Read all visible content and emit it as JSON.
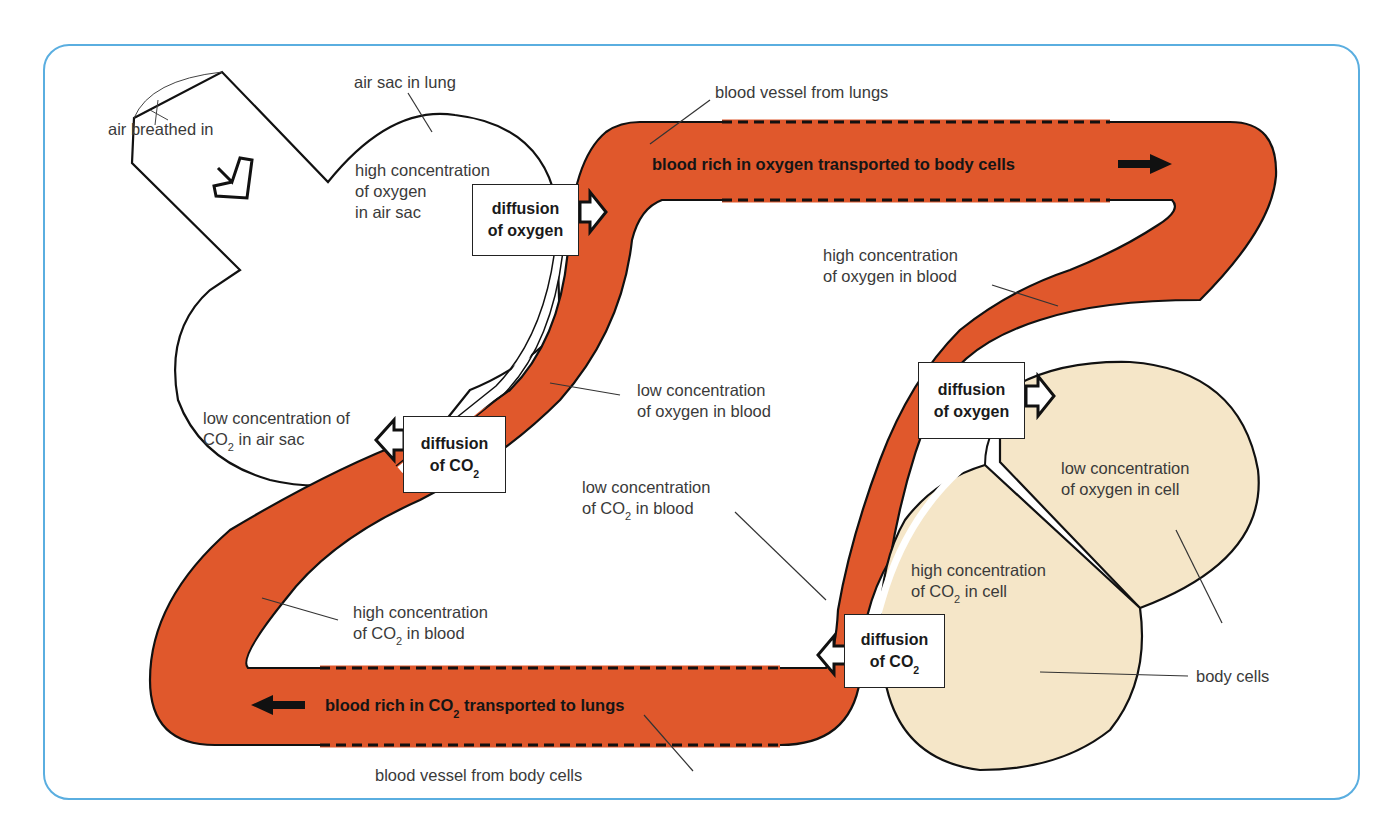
{
  "colors": {
    "vessel": "#E0582C",
    "cell": "#F5E6C8",
    "frame": "#5AAEE0",
    "outline": "#111111"
  },
  "labels": {
    "air_breathed_in": "air breathed in",
    "air_sac_in_lung": "air sac in lung",
    "high_oxygen_air_sac": [
      "high concentration",
      "of oxygen",
      "in air sac"
    ],
    "low_co2_air_sac": [
      "low concentration of",
      "CO",
      "2",
      " in air sac"
    ],
    "blood_vessel_from_lungs": "blood vessel from lungs",
    "high_oxygen_blood": [
      "high concentration",
      "of oxygen in blood"
    ],
    "low_oxygen_blood": [
      "low concentration",
      "of oxygen in blood"
    ],
    "low_co2_blood": [
      "low concentration",
      "of CO",
      "2",
      " in blood"
    ],
    "high_co2_blood": [
      "high concentration",
      "of CO",
      "2",
      " in blood"
    ],
    "low_oxygen_cell": [
      "low concentration",
      "of oxygen in cell"
    ],
    "high_co2_cell": [
      "high concentration",
      "of CO",
      "2",
      " in cell"
    ],
    "body_cells": "body cells",
    "blood_vessel_from_body_cells": "blood vessel from body cells"
  },
  "flow_labels": {
    "top": "blood rich in oxygen transported to body cells",
    "bottom": [
      "blood rich in CO",
      "2",
      " transported to lungs"
    ]
  },
  "boxes": {
    "lung_oxygen": [
      "diffusion",
      "of oxygen"
    ],
    "lung_co2": [
      "diffusion",
      "of CO",
      "2"
    ],
    "cell_oxygen": [
      "diffusion",
      "of oxygen"
    ],
    "cell_co2": [
      "diffusion",
      "of CO",
      "2"
    ]
  }
}
